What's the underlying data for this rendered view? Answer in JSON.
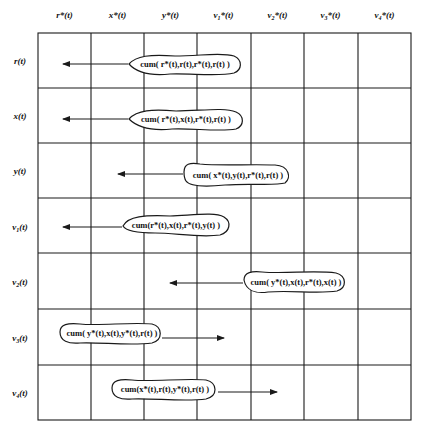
{
  "diagram": {
    "type": "cumulant-matrix",
    "columns": [
      {
        "base": "r",
        "sub": "",
        "suffix": "*(t)"
      },
      {
        "base": "x",
        "sub": "",
        "suffix": "*(t)"
      },
      {
        "base": "y",
        "sub": "",
        "suffix": "*(t)"
      },
      {
        "base": "v",
        "sub": "1",
        "suffix": "*(t)"
      },
      {
        "base": "v",
        "sub": "2",
        "suffix": "*(t)"
      },
      {
        "base": "v",
        "sub": "3",
        "suffix": "*(t)"
      },
      {
        "base": "v",
        "sub": "4",
        "suffix": "*(t)"
      }
    ],
    "rows": [
      {
        "base": "r",
        "sub": "",
        "suffix": "(t)"
      },
      {
        "base": "x",
        "sub": "",
        "suffix": "(t)"
      },
      {
        "base": "y",
        "sub": "",
        "suffix": "(t)"
      },
      {
        "base": "v",
        "sub": "1",
        "suffix": "(t)"
      },
      {
        "base": "v",
        "sub": "2",
        "suffix": "(t)"
      },
      {
        "base": "v",
        "sub": "3",
        "suffix": "(t)"
      },
      {
        "base": "v",
        "sub": "4",
        "suffix": "(t)"
      }
    ],
    "entries": [
      {
        "row": "r(t)",
        "label": "cum( r*(t),r(t),r*(t),r(t) )",
        "blob": [
          128,
          240,
          64
        ],
        "arrow": {
          "from": 128,
          "to": 63,
          "y": 64,
          "dir": "left"
        }
      },
      {
        "row": "x(t)",
        "label": "cum( r*(t),x(t),r*(t),r(t) )",
        "blob": [
          128,
          242,
          119
        ],
        "arrow": {
          "from": 128,
          "to": 63,
          "y": 119,
          "dir": "left"
        }
      },
      {
        "row": "y(t)",
        "label": "cum( x*(t),y(t),r*(t),r(t) )",
        "blob": [
          183,
          290,
          175
        ],
        "arrow": {
          "from": 183,
          "to": 118,
          "y": 174,
          "dir": "left"
        }
      },
      {
        "row": "v1(t)",
        "label": "cum(r*(t),x(t),r*(t),y(t) )",
        "blob": [
          122,
          228,
          225
        ],
        "arrow": {
          "from": 122,
          "to": 63,
          "y": 227,
          "dir": "left"
        }
      },
      {
        "row": "v2(t)",
        "label": "cum( y*(t),x(t),r*(t),x(t) )",
        "blob": [
          243,
          345,
          282
        ],
        "arrow": {
          "from": 243,
          "to": 170,
          "y": 283,
          "dir": "left"
        }
      },
      {
        "row": "v3(t)",
        "label": "cum( y*(t),x(t),y*(t),r(t) )",
        "blob": [
          58,
          162,
          333
        ],
        "arrow": {
          "from": 162,
          "to": 224,
          "y": 338,
          "dir": "right"
        }
      },
      {
        "row": "v4(t)",
        "label": "cum(x*(t),r(t),y*(t),r(t) )",
        "blob": [
          110,
          218,
          389
        ],
        "arrow": {
          "from": 218,
          "to": 277,
          "y": 392,
          "dir": "right"
        }
      }
    ],
    "grid": {
      "left": 38,
      "top": 33,
      "right": 411,
      "bottom": 420,
      "cols": 7,
      "rows": 7
    },
    "colors": {
      "line": "#1a1a1a",
      "background": "#ffffff",
      "text": "#111111"
    }
  }
}
